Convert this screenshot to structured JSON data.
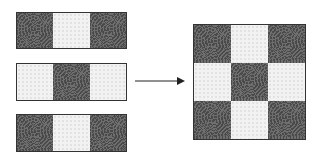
{
  "diagram": {
    "patterns": {
      "dark": "dark swirl pattern",
      "light": "light speckled pattern"
    },
    "strips": [
      {
        "cells": [
          "dark",
          "light",
          "dark"
        ]
      },
      {
        "cells": [
          "light",
          "dark",
          "light"
        ]
      },
      {
        "cells": [
          "dark",
          "light",
          "dark"
        ]
      }
    ],
    "arrow": {
      "direction": "right"
    },
    "result_grid": {
      "rows": 3,
      "cols": 3,
      "cells": [
        [
          "dark",
          "light",
          "dark"
        ],
        [
          "light",
          "dark",
          "light"
        ],
        [
          "dark",
          "light",
          "dark"
        ]
      ]
    },
    "colors": {
      "dark": "#4a4a4a",
      "light": "#f2f2f2",
      "border": "#333333",
      "arrow": "#222222"
    }
  }
}
